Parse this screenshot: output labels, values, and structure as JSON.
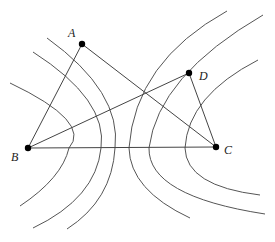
{
  "diagram": {
    "type": "geometry",
    "points": [
      {
        "id": "A",
        "label": "A",
        "x": 82,
        "y": 44,
        "label_x": 68,
        "label_y": 28
      },
      {
        "id": "B",
        "label": "B",
        "x": 28,
        "y": 148,
        "label_x": 12,
        "label_y": 156
      },
      {
        "id": "C",
        "label": "C",
        "x": 216,
        "y": 147,
        "label_x": 225,
        "label_y": 145
      },
      {
        "id": "D",
        "label": "D",
        "x": 189,
        "y": 73,
        "label_x": 199,
        "label_y": 70
      }
    ],
    "segments": [
      {
        "from": "A",
        "to": "B"
      },
      {
        "from": "A",
        "to": "C"
      },
      {
        "from": "B",
        "to": "C"
      },
      {
        "from": "B",
        "to": "D"
      },
      {
        "from": "D",
        "to": "C"
      }
    ],
    "curves": [
      {
        "id": "L1",
        "family": "left",
        "path": "M10,83 Q92,122 69,148 Q62,178 20,206"
      },
      {
        "id": "L2",
        "family": "left",
        "path": "M33,52 Q108,100 101,148 Q96,198 33,228"
      },
      {
        "id": "L3",
        "family": "left",
        "path": "M47,38 Q122,92 115,148 Q112,200 67,229"
      },
      {
        "id": "R1",
        "family": "right",
        "path": "M227,11 Q135,62 129,148 Q130,190 190,218"
      },
      {
        "id": "R2",
        "family": "right",
        "path": "M263,15 Q158,76 149,148 Q148,196 265,214"
      },
      {
        "id": "R3",
        "family": "right",
        "path": "M258,60 Q188,96 185,148 Q186,186 260,195"
      }
    ]
  }
}
